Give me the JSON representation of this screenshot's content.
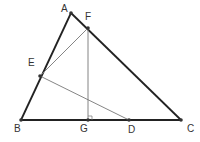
{
  "diagram": {
    "type": "geometry",
    "colors": {
      "triangle_stroke": "#222222",
      "aux_stroke": "#777777",
      "point_fill": "#333333",
      "label": "#333333"
    },
    "points": [
      {
        "id": "A",
        "label": "A",
        "x": 71,
        "y": 13,
        "lx": 61,
        "ly": 12
      },
      {
        "id": "F",
        "label": "F",
        "x": 88,
        "y": 28,
        "lx": 85,
        "ly": 20
      },
      {
        "id": "E",
        "label": "E",
        "x": 40,
        "y": 76,
        "lx": 28,
        "ly": 66
      },
      {
        "id": "B",
        "label": "B",
        "x": 21,
        "y": 120,
        "lx": 14,
        "ly": 132
      },
      {
        "id": "G",
        "label": "G",
        "x": 88,
        "y": 120,
        "lx": 80,
        "ly": 132
      },
      {
        "id": "D",
        "label": "D",
        "x": 129,
        "y": 120,
        "lx": 128,
        "ly": 133
      },
      {
        "id": "C",
        "label": "C",
        "x": 181,
        "y": 120,
        "lx": 187,
        "ly": 132
      }
    ],
    "segments": [
      {
        "from": "A",
        "to": "B",
        "style": "main"
      },
      {
        "from": "A",
        "to": "C",
        "style": "main"
      },
      {
        "from": "B",
        "to": "C",
        "style": "main"
      },
      {
        "from": "E",
        "to": "F",
        "style": "aux"
      },
      {
        "from": "F",
        "to": "G",
        "style": "aux"
      },
      {
        "from": "E",
        "to": "D",
        "style": "aux"
      }
    ],
    "right_angle_marker": {
      "at": "G",
      "label": "right-angle at G"
    }
  }
}
